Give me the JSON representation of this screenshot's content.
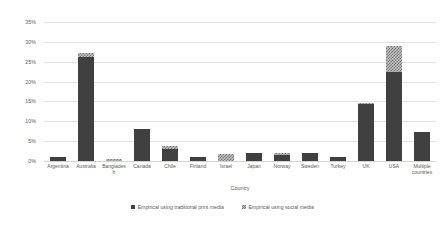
{
  "chart_data": {
    "type": "bar",
    "subtype": "stacked-column",
    "title": "",
    "xlabel": "Country",
    "ylabel": "",
    "ylim": [
      0,
      35
    ],
    "ytick_labels": [
      "0%",
      "5%",
      "10%",
      "15%",
      "20%",
      "25%",
      "30%",
      "35%"
    ],
    "ytick_values": [
      0,
      5,
      10,
      15,
      20,
      25,
      30,
      35
    ],
    "grid": true,
    "legend_position": "bottom",
    "categories": [
      "Argentina",
      "Australia",
      "Bangladesh",
      "Canada",
      "Chile",
      "Finland",
      "Israel",
      "Japan",
      "Norway",
      "Sweden",
      "Turkey",
      "UK",
      "USA",
      "Multiple countries"
    ],
    "series": [
      {
        "name": "Empirical using traditional print media",
        "color": "#404040",
        "values": [
          1.0,
          26.2,
          0.0,
          8.0,
          3.0,
          1.0,
          0.0,
          1.9,
          1.5,
          1.9,
          1.0,
          14.3,
          22.5,
          7.3
        ]
      },
      {
        "name": "Empirical using social media",
        "color": "#bfbfbf",
        "values": [
          0.0,
          0.9,
          0.4,
          0.0,
          0.8,
          0.0,
          1.8,
          0.0,
          0.4,
          0.0,
          0.0,
          0.3,
          6.4,
          0.0
        ]
      }
    ]
  },
  "legend": {
    "items": [
      {
        "label": "Empirical using traditional print media"
      },
      {
        "label": "Empirical using social media"
      }
    ]
  }
}
